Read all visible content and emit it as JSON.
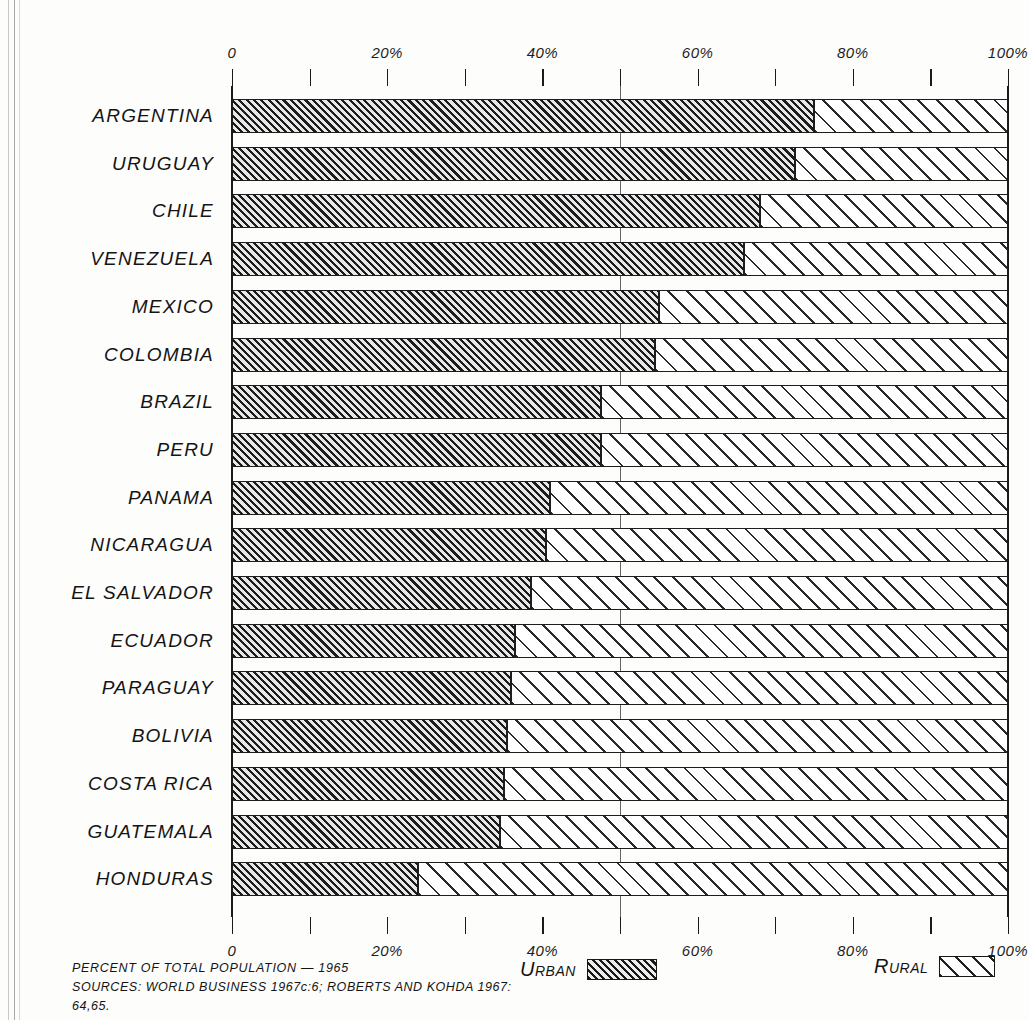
{
  "figure": {
    "cropped_title_fragment": "",
    "caption_line1": "PERCENT OF TOTAL POPULATION — 1965",
    "caption_line2": "SOURCES:  WORLD BUSINESS 1967c:6;  ROBERTS AND KOHDA 1967: 64,65."
  },
  "legend": {
    "urban_label": "Urban",
    "rural_label": "Rural",
    "urban_swatch": "dense-diagonal-hatch-dark",
    "rural_swatch": "sparse-diagonal-hatch-light"
  },
  "colors": {
    "ink": "#1a1a1a",
    "urban_fill": "#8d8d8d",
    "rural_fill": "#ffffff",
    "paper": "#fdfdfc"
  },
  "axis": {
    "top_tick_values": [
      0,
      10,
      20,
      30,
      40,
      50,
      60,
      70,
      80,
      90,
      100
    ],
    "top_tick_labels": [
      "0",
      "",
      "20%",
      "",
      "40%",
      "",
      "60%",
      "",
      "80%",
      "",
      "100%"
    ],
    "bottom_tick_values": [
      0,
      10,
      20,
      30,
      40,
      50,
      60,
      70,
      80,
      90,
      100
    ],
    "bottom_tick_labels": [
      "0",
      "",
      "20%",
      "",
      "40%",
      "",
      "60%",
      "",
      "80%",
      "",
      "100%"
    ]
  },
  "chart_data": {
    "type": "bar",
    "orientation": "horizontal",
    "stacked": true,
    "title": "",
    "subtitle": "",
    "xlabel": "PERCENT OF TOTAL POPULATION — 1965",
    "ylabel": "",
    "xlim": [
      0,
      100
    ],
    "grid": false,
    "legend_position": "bottom",
    "units": "percent",
    "categories": [
      "ARGENTINA",
      "URUGUAY",
      "CHILE",
      "VENEZUELA",
      "MEXICO",
      "COLOMBIA",
      "BRAZIL",
      "PERU",
      "PANAMA",
      "NICARAGUA",
      "EL SALVADOR",
      "ECUADOR",
      "PARAGUAY",
      "BOLIVIA",
      "COSTA RICA",
      "GUATEMALA",
      "HONDURAS"
    ],
    "series": [
      {
        "name": "Urban",
        "values": [
          75,
          72.5,
          68,
          66,
          55,
          54.5,
          47.5,
          47.5,
          41,
          40.5,
          38.5,
          36.5,
          36,
          35.5,
          35,
          34.5,
          24
        ]
      },
      {
        "name": "Rural",
        "values": [
          25,
          27.5,
          32,
          34,
          45,
          45.5,
          52.5,
          52.5,
          59,
          59.5,
          61.5,
          63.5,
          64,
          64.5,
          65,
          65.5,
          76
        ]
      }
    ]
  }
}
